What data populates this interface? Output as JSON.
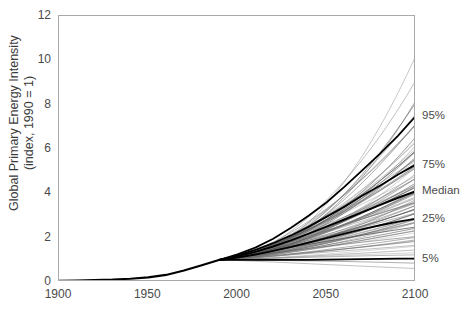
{
  "chart_data": {
    "type": "line",
    "title": "",
    "subtitle": "",
    "xlabel": "",
    "ylabel": "Global Primary Energy Intensity (index, 1990 = 1)",
    "ylabel_line1": "Global Primary Energy Intensity",
    "ylabel_line2": "(index, 1990 = 1)",
    "xlim": [
      1900,
      2100
    ],
    "ylim": [
      0,
      12
    ],
    "grid": false,
    "legend_position": "right-inline-labels",
    "x_ticks": [
      1900,
      1950,
      2000,
      2050,
      2100
    ],
    "x_tick_labels": [
      "1900",
      "1950",
      "2000",
      "2050",
      "2100"
    ],
    "x_minor_tick_interval": 10,
    "y_ticks": [
      0,
      2,
      4,
      6,
      8,
      10,
      12
    ],
    "y_tick_labels": [
      "0",
      "2",
      "4",
      "6",
      "8",
      "10",
      "12"
    ],
    "annotations": [
      {
        "label": "95%",
        "x": 2100,
        "y": 7.5
      },
      {
        "label": "75%",
        "x": 2100,
        "y": 5.3
      },
      {
        "label": "Median",
        "x": 2100,
        "y": 4.1
      },
      {
        "label": "25%",
        "x": 2100,
        "y": 2.85
      },
      {
        "label": "5%",
        "x": 2100,
        "y": 1.05
      }
    ],
    "series": [
      {
        "name": "Historical",
        "style": "bold-black",
        "x": [
          1900,
          1910,
          1920,
          1930,
          1940,
          1950,
          1960,
          1970,
          1980,
          1990
        ],
        "values": [
          0.05,
          0.07,
          0.09,
          0.11,
          0.15,
          0.21,
          0.32,
          0.52,
          0.76,
          1.0
        ]
      },
      {
        "name": "95th percentile",
        "style": "bold-black",
        "x": [
          1990,
          2000,
          2010,
          2020,
          2030,
          2040,
          2050,
          2060,
          2070,
          2080,
          2090,
          2100
        ],
        "values": [
          1.0,
          1.25,
          1.55,
          1.95,
          2.45,
          3.0,
          3.6,
          4.3,
          5.05,
          5.8,
          6.6,
          7.5
        ]
      },
      {
        "name": "75th percentile",
        "style": "bold-black",
        "x": [
          1990,
          2000,
          2010,
          2020,
          2030,
          2040,
          2050,
          2060,
          2070,
          2080,
          2090,
          2100
        ],
        "values": [
          1.0,
          1.2,
          1.45,
          1.75,
          2.1,
          2.5,
          2.95,
          3.4,
          3.9,
          4.35,
          4.85,
          5.3
        ]
      },
      {
        "name": "Median",
        "style": "bold-black",
        "x": [
          1990,
          2000,
          2010,
          2020,
          2030,
          2040,
          2050,
          2060,
          2070,
          2080,
          2090,
          2100
        ],
        "values": [
          1.0,
          1.16,
          1.36,
          1.6,
          1.88,
          2.18,
          2.5,
          2.82,
          3.15,
          3.48,
          3.8,
          4.1
        ]
      },
      {
        "name": "25th percentile",
        "style": "bold-black",
        "x": [
          1990,
          2000,
          2010,
          2020,
          2030,
          2040,
          2050,
          2060,
          2070,
          2080,
          2090,
          2100
        ],
        "values": [
          1.0,
          1.1,
          1.24,
          1.4,
          1.58,
          1.78,
          1.98,
          2.18,
          2.38,
          2.56,
          2.72,
          2.85
        ]
      },
      {
        "name": "5th percentile",
        "style": "bold-black",
        "x": [
          1990,
          2000,
          2010,
          2020,
          2030,
          2040,
          2050,
          2060,
          2070,
          2080,
          2090,
          2100
        ],
        "values": [
          1.0,
          1.0,
          1.0,
          1.0,
          1.0,
          1.0,
          1.01,
          1.02,
          1.03,
          1.04,
          1.05,
          1.05
        ]
      },
      {
        "name": "Scenario ensemble",
        "style": "thin-grey-spaghetti",
        "count": 80,
        "x_start": 1990,
        "x_end": 2100,
        "y_start": 1.0,
        "y_end_min": 0.55,
        "y_end_max": 10.5,
        "endpoint_values": [
          10.5,
          9.35,
          8.3,
          7.9,
          7.6,
          7.35,
          7.1,
          6.9,
          6.7,
          6.55,
          6.4,
          6.25,
          6.1,
          6.0,
          5.9,
          5.8,
          5.7,
          5.6,
          5.5,
          5.42,
          5.34,
          5.26,
          5.18,
          5.1,
          5.02,
          4.94,
          4.86,
          4.78,
          4.7,
          4.62,
          4.55,
          4.48,
          4.41,
          4.34,
          4.27,
          4.2,
          4.13,
          4.06,
          4.0,
          3.94,
          3.88,
          3.82,
          3.76,
          3.7,
          3.64,
          3.58,
          3.52,
          3.46,
          3.4,
          3.34,
          3.28,
          3.22,
          3.16,
          3.1,
          3.04,
          2.98,
          2.92,
          2.86,
          2.8,
          2.74,
          2.68,
          2.6,
          2.52,
          2.44,
          2.36,
          2.28,
          2.2,
          2.12,
          2.04,
          1.96,
          1.88,
          1.78,
          1.68,
          1.58,
          1.46,
          1.34,
          1.22,
          1.05,
          0.85,
          0.6
        ]
      }
    ]
  }
}
